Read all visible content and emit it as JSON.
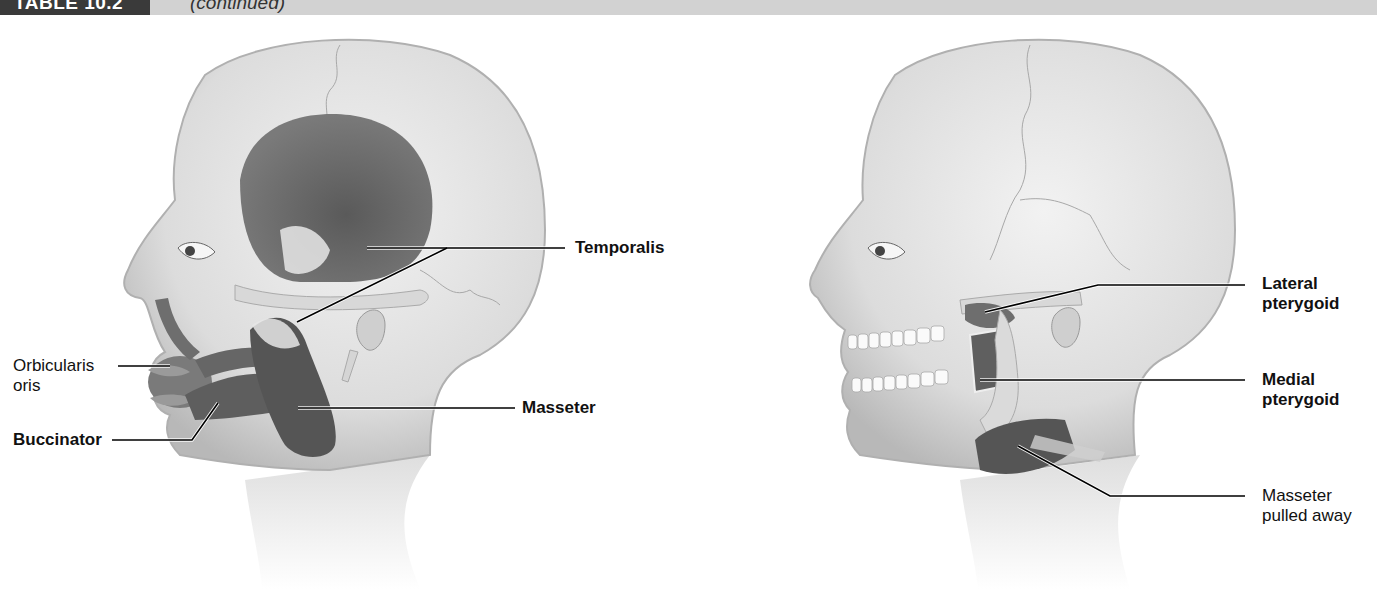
{
  "header": {
    "table_number": "TABLE 10.2",
    "continued": "(continued)"
  },
  "figures": [
    {
      "name": "superficial-view",
      "labels": [
        {
          "id": "temporalis",
          "text": "Temporalis",
          "bold": true
        },
        {
          "id": "masseter",
          "text": "Masseter",
          "bold": true
        },
        {
          "id": "orbicularis-oris",
          "line1": "Orbicularis",
          "line2": "oris",
          "bold": false
        },
        {
          "id": "buccinator",
          "text": "Buccinator",
          "bold": true
        }
      ]
    },
    {
      "name": "deep-view",
      "labels": [
        {
          "id": "lateral-pterygoid",
          "line1": "Lateral",
          "line2": "pterygoid",
          "bold": true
        },
        {
          "id": "medial-pterygoid",
          "line1": "Medial",
          "line2": "pterygoid",
          "bold": true
        },
        {
          "id": "masseter-pulled-away",
          "line1": "Masseter",
          "line2": "pulled away",
          "bold": false
        }
      ]
    }
  ],
  "colors": {
    "header_band": "#d2d2d2",
    "header_box": "#3a3a3a",
    "skin": "#e4e4e4",
    "skin_shadow": "#bdbdbd",
    "muscle": "#6a6a6a",
    "muscle_dark": "#4a4a4a",
    "leader_line": "#000000"
  }
}
